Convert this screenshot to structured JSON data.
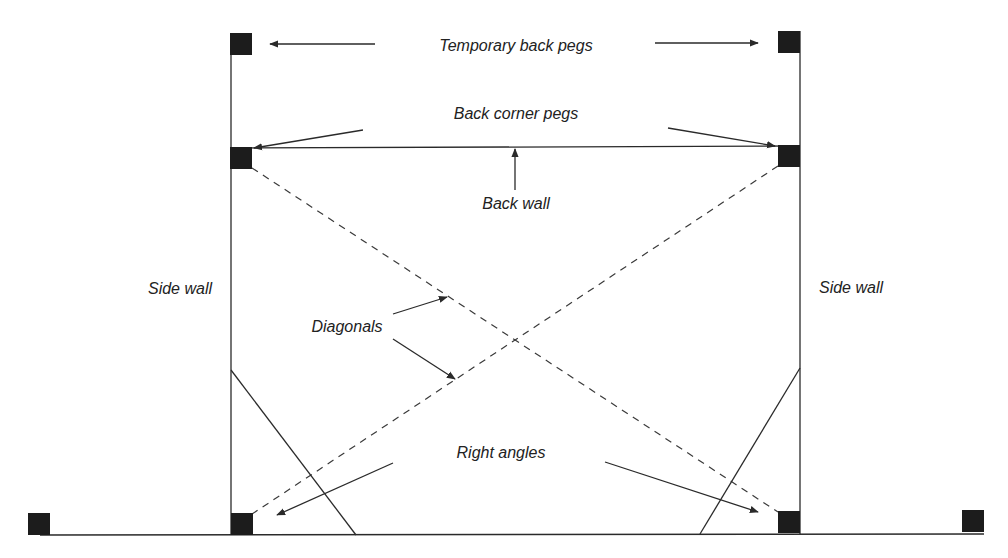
{
  "diagram": {
    "type": "setting-out plan",
    "colors": {
      "line": "#2a2a2a",
      "peg": "#1c1c1c",
      "text": "#222222",
      "background": "#ffffff"
    },
    "labels": {
      "temporary_back_pegs": "Temporary back pegs",
      "back_corner_pegs": "Back corner pegs",
      "back_wall": "Back wall",
      "side_wall_left": "Side wall",
      "side_wall_right": "Side wall",
      "diagonals": "Diagonals",
      "right_angles": "Right angles"
    },
    "nodes": [
      {
        "id": "temp-peg-left",
        "label": "Temporary back peg"
      },
      {
        "id": "temp-peg-right",
        "label": "Temporary back peg"
      },
      {
        "id": "back-corner-peg-left",
        "label": "Back corner peg"
      },
      {
        "id": "back-corner-peg-right",
        "label": "Back corner peg"
      },
      {
        "id": "front-corner-peg-left",
        "label": "Front corner peg"
      },
      {
        "id": "front-corner-peg-right",
        "label": "Front corner peg"
      },
      {
        "id": "baseline-peg-left",
        "label": "Baseline peg"
      },
      {
        "id": "baseline-peg-right",
        "label": "Baseline peg"
      }
    ],
    "edges": [
      {
        "from": "back-corner-peg-left",
        "to": "back-corner-peg-right",
        "label": "Back wall",
        "style": "solid"
      },
      {
        "from": "temp-peg-left",
        "to": "front-corner-peg-left",
        "label": "Side wall",
        "style": "solid"
      },
      {
        "from": "temp-peg-right",
        "to": "front-corner-peg-right",
        "label": "Side wall",
        "style": "solid"
      },
      {
        "from": "baseline-peg-left",
        "to": "baseline-peg-right",
        "label": "Front building line",
        "style": "solid"
      },
      {
        "from": "back-corner-peg-left",
        "to": "front-corner-peg-right",
        "label": "Diagonal",
        "style": "dashed"
      },
      {
        "from": "back-corner-peg-right",
        "to": "front-corner-peg-left",
        "label": "Diagonal",
        "style": "dashed"
      }
    ]
  }
}
